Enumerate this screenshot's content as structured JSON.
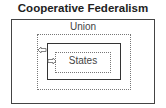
{
  "title": "Cooperative Federalism",
  "outer_label": "Union",
  "inner_label": "States",
  "arrows": [
    {
      "direction": "left",
      "meaning": "states-to-union"
    },
    {
      "direction": "right",
      "meaning": "union-to-states"
    }
  ],
  "colors": {
    "border": "#444444",
    "dotted": "#777777",
    "text": "#222222"
  }
}
